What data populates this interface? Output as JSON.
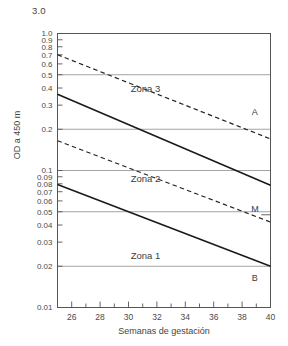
{
  "chart_data": {
    "type": "line",
    "title": "",
    "xlabel": "Semanas de gestación",
    "ylabel": "OD a 450 m",
    "yscale": "log",
    "ylim": [
      0.01,
      1.0
    ],
    "xlim": [
      25,
      40
    ],
    "grid": true,
    "grid_values": [
      0.5,
      0.2,
      0.1,
      0.05,
      0.02
    ],
    "above_axis_label": "3.0",
    "ytick_labels": [
      "1.0",
      "0.9",
      "0.8",
      "0.7",
      "0.6",
      "0.5",
      "0.4",
      "0.3",
      "0.2",
      "0.1",
      "0.09",
      "0.08",
      "0.07",
      "0.06",
      "0.05",
      "0.04",
      "0.03",
      "0.02",
      "0.01"
    ],
    "ytick_values": [
      1.0,
      0.9,
      0.8,
      0.7,
      0.6,
      0.5,
      0.4,
      0.3,
      0.2,
      0.1,
      0.09,
      0.08,
      0.07,
      0.06,
      0.05,
      0.04,
      0.03,
      0.02,
      0.01
    ],
    "xtick_labels": [
      "26",
      "28",
      "30",
      "32",
      "34",
      "36",
      "38",
      "40"
    ],
    "xtick_values": [
      26,
      28,
      30,
      32,
      34,
      36,
      38,
      40
    ],
    "xminor_values": [
      25,
      27,
      29,
      31,
      33,
      35,
      37,
      39
    ],
    "series": [
      {
        "name": "Límite superior Zona 3",
        "style": "dashed",
        "color": "#222222",
        "x": [
          25,
          40
        ],
        "y": [
          0.7,
          0.17
        ]
      },
      {
        "name": "Curva A",
        "style": "solid",
        "color": "#1a1a1a",
        "x": [
          25,
          40
        ],
        "y": [
          0.36,
          0.078
        ]
      },
      {
        "name": "Límite Zona 2",
        "style": "dashed",
        "color": "#222222",
        "x": [
          25,
          40
        ],
        "y": [
          0.165,
          0.042
        ]
      },
      {
        "name": "Curva B",
        "style": "solid",
        "color": "#1a1a1a",
        "x": [
          25,
          40
        ],
        "y": [
          0.079,
          0.02
        ]
      }
    ],
    "annotations": [
      {
        "text": "Zona 3",
        "x": 31.2,
        "y": 0.375
      },
      {
        "text": "Zona 2",
        "x": 31.2,
        "y": 0.082
      },
      {
        "text": "Zona 1",
        "x": 31.2,
        "y": 0.0225
      },
      {
        "text": "A",
        "x": 38.9,
        "y": 0.255
      },
      {
        "text": "M",
        "x": 38.9,
        "y": 0.05
      },
      {
        "text": "B",
        "x": 38.9,
        "y": 0.0155
      }
    ]
  }
}
